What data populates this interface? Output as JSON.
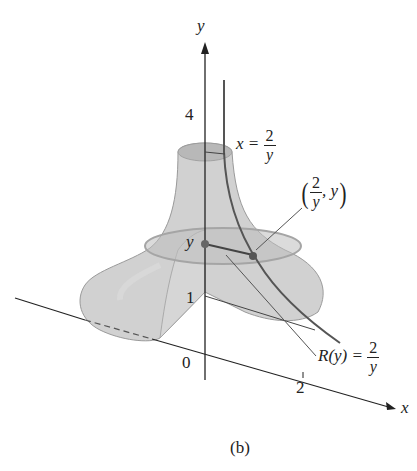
{
  "figure": {
    "caption": "(b)",
    "axes": {
      "y_label": "y",
      "x_label": "x",
      "origin_label": "0",
      "y_tick_4": "4",
      "y_tick_1": "1",
      "y_tick_y": "y",
      "x_tick_2": "2"
    },
    "annotations": {
      "curve_label": {
        "lhs": "x =",
        "num": "2",
        "den": "y"
      },
      "point_label": {
        "num": "2",
        "den": "y",
        "suffix": ", y"
      },
      "radius_label": {
        "lhs": "R(y) =",
        "num": "2",
        "den": "y"
      }
    },
    "colors": {
      "solid_fill": "#c8c8c8",
      "solid_fill_dark": "#b4b4b4",
      "curve": "#555555",
      "axis": "#222222",
      "point": "#555555"
    }
  }
}
